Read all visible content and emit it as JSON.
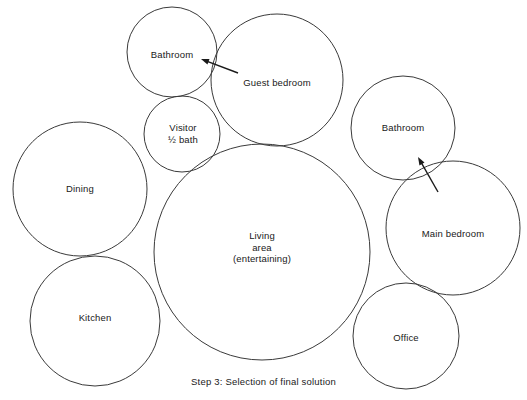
{
  "figure": {
    "type": "bubble-diagram",
    "caption": "Step 3:  Selection of final solution",
    "caption_y": 376,
    "background_color": "#ffffff",
    "stroke_color": "#3a3a3a",
    "text_color": "#202020",
    "width": 527,
    "height": 400
  },
  "bubbles": [
    {
      "id": "bathroom-upper",
      "label": "Bathroom",
      "cx": 172,
      "cy": 52,
      "r": 45,
      "label_x": 172,
      "label_y": 55
    },
    {
      "id": "guest-bedroom",
      "label": "Guest bedroom",
      "cx": 277,
      "cy": 80,
      "r": 66,
      "label_x": 277,
      "label_y": 83
    },
    {
      "id": "visitor-half-bath",
      "label": "Visitor\n½ bath",
      "cx": 182,
      "cy": 134,
      "r": 38,
      "label_x": 183,
      "label_y": 133
    },
    {
      "id": "bathroom-right",
      "label": "Bathroom",
      "cx": 403,
      "cy": 128,
      "r": 52,
      "label_x": 403,
      "label_y": 128
    },
    {
      "id": "dining",
      "label": "Dining",
      "cx": 80,
      "cy": 189,
      "r": 67,
      "label_x": 80,
      "label_y": 189
    },
    {
      "id": "living-area",
      "label": "Living\narea\n(entertaining)",
      "cx": 262,
      "cy": 252,
      "r": 108,
      "label_x": 262,
      "label_y": 247
    },
    {
      "id": "main-bedroom",
      "label": "Main bedroom",
      "cx": 453,
      "cy": 228,
      "r": 67,
      "label_x": 453,
      "label_y": 234
    },
    {
      "id": "kitchen",
      "label": "Kitchen",
      "cx": 95,
      "cy": 321,
      "r": 65,
      "label_x": 95,
      "label_y": 318
    },
    {
      "id": "office",
      "label": "Office",
      "cx": 406,
      "cy": 336,
      "r": 53,
      "label_x": 406,
      "label_y": 338
    }
  ],
  "arrows": [
    {
      "id": "arrow-to-bathroom-upper",
      "x1": 238,
      "y1": 73,
      "x2": 201,
      "y2": 59,
      "head_at": "x2"
    },
    {
      "id": "arrow-to-bathroom-right",
      "x1": 438,
      "y1": 192,
      "x2": 418,
      "y2": 157,
      "head_at": "x2"
    }
  ]
}
